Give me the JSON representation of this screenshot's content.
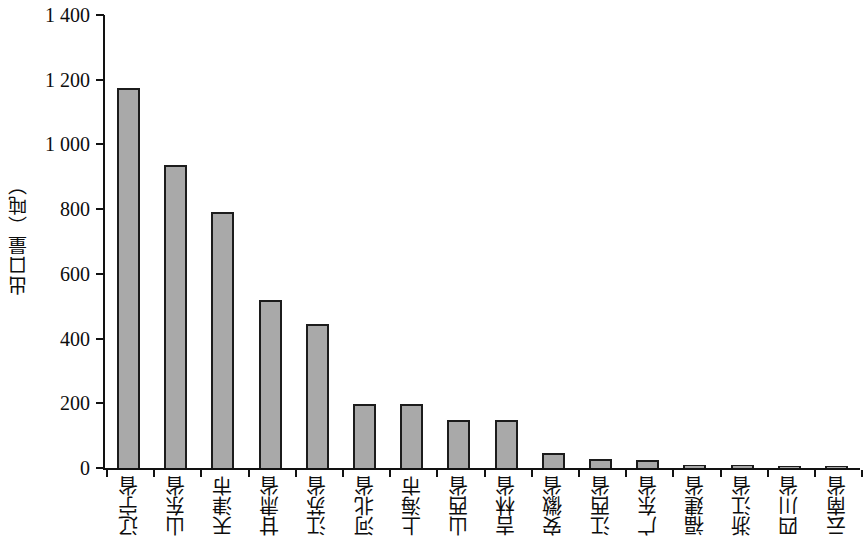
{
  "chart_data": {
    "type": "bar",
    "title": "",
    "xlabel": "",
    "ylabel": "出口量（吨）",
    "ylim": [
      0,
      1400
    ],
    "ytick_step": 200,
    "grid": false,
    "legend": null,
    "bar_fill_color": "#a9a9a9",
    "bar_border_color": "#1c1c1c",
    "axis_color": "#121212",
    "background_color": "#ffffff",
    "ytick_labels": [
      "1 400",
      "1 200",
      "1 000",
      "800",
      "600",
      "400",
      "200",
      "0"
    ],
    "ytick_values": [
      1400,
      1200,
      1000,
      800,
      600,
      400,
      200,
      0
    ],
    "categories": [
      "辽宁省",
      "山东省",
      "天津市",
      "甘肃省",
      "江苏省",
      "河北省",
      "上海市",
      "山西省",
      "吉林省",
      "安徽省",
      "江西省",
      "广东省",
      "福建省",
      "浙江省",
      "四川省",
      "云南省"
    ],
    "values": [
      1175,
      935,
      790,
      520,
      445,
      197,
      197,
      148,
      148,
      45,
      28,
      25,
      10,
      8,
      7,
      5
    ]
  }
}
